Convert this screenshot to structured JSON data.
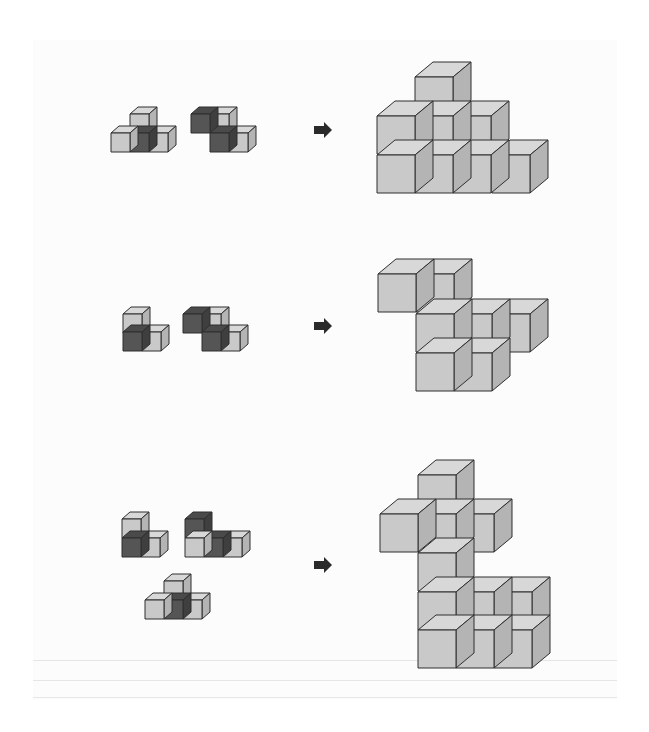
{
  "colors": {
    "front": "#c9c9c9",
    "top": "#d8d8d8",
    "side": "#b4b4b4",
    "dark_front": "#555555",
    "dark_top": "#4a4a4a",
    "dark_side": "#3f3f3f",
    "stroke": "#2f2f2f",
    "arrow": "#2a2a2a"
  },
  "puzzles": [
    {
      "label": "row-1",
      "pieces": [
        {
          "size": 19,
          "dx": 8,
          "dy": 7,
          "cubes": [
            {
              "x": 130,
              "y": 114,
              "dark": false
            },
            {
              "x": 111,
              "y": 133,
              "dark": false
            },
            {
              "x": 130,
              "y": 133,
              "dark": true
            },
            {
              "x": 149,
              "y": 133,
              "dark": false
            }
          ]
        },
        {
          "size": 19,
          "dx": 8,
          "dy": 7,
          "cubes": [
            {
              "x": 191,
              "y": 114,
              "dark": true
            },
            {
              "x": 210,
              "y": 114,
              "dark": false
            },
            {
              "x": 210,
              "y": 133,
              "dark": true
            },
            {
              "x": 229,
              "y": 133,
              "dark": false
            }
          ]
        }
      ],
      "arrow": {
        "x": 314,
        "y": 130
      },
      "result": {
        "size": 38,
        "dx": 18,
        "dy": 15,
        "cubes": [
          {
            "x": 415,
            "y": 77
          },
          {
            "x": 377,
            "y": 116
          },
          {
            "x": 415,
            "y": 116
          },
          {
            "x": 453,
            "y": 116
          },
          {
            "x": 377,
            "y": 155
          },
          {
            "x": 415,
            "y": 155
          },
          {
            "x": 453,
            "y": 155
          },
          {
            "x": 492,
            "y": 155
          }
        ]
      }
    },
    {
      "label": "row-2",
      "pieces": [
        {
          "size": 19,
          "dx": 8,
          "dy": 7,
          "cubes": [
            {
              "x": 123,
              "y": 314,
              "dark": false
            },
            {
              "x": 123,
              "y": 332,
              "dark": true
            },
            {
              "x": 142,
              "y": 332,
              "dark": false
            }
          ]
        },
        {
          "size": 19,
          "dx": 8,
          "dy": 7,
          "cubes": [
            {
              "x": 183,
              "y": 314,
              "dark": true
            },
            {
              "x": 202,
              "y": 314,
              "dark": false
            },
            {
              "x": 202,
              "y": 332,
              "dark": true
            },
            {
              "x": 221,
              "y": 332,
              "dark": false
            }
          ]
        }
      ],
      "arrow": {
        "x": 314,
        "y": 326
      },
      "result": {
        "size": 38,
        "dx": 18,
        "dy": 15,
        "cubes": [
          {
            "x": 378,
            "y": 274
          },
          {
            "x": 416,
            "y": 274
          },
          {
            "x": 416,
            "y": 353
          },
          {
            "x": 454,
            "y": 353
          },
          {
            "x": 416,
            "y": 314
          },
          {
            "x": 454,
            "y": 314
          },
          {
            "x": 492,
            "y": 314
          }
        ]
      }
    },
    {
      "label": "row-3",
      "pieces": [
        {
          "size": 19,
          "dx": 8,
          "dy": 7,
          "cubes": [
            {
              "x": 122,
              "y": 519,
              "dark": false
            },
            {
              "x": 122,
              "y": 538,
              "dark": true
            },
            {
              "x": 141,
              "y": 538,
              "dark": false
            }
          ]
        },
        {
          "size": 19,
          "dx": 8,
          "dy": 7,
          "cubes": [
            {
              "x": 185,
              "y": 519,
              "dark": true
            },
            {
              "x": 185,
              "y": 538,
              "dark": false
            },
            {
              "x": 204,
              "y": 538,
              "dark": true
            },
            {
              "x": 223,
              "y": 538,
              "dark": false
            }
          ]
        },
        {
          "size": 19,
          "dx": 8,
          "dy": 7,
          "cubes": [
            {
              "x": 164,
              "y": 581,
              "dark": false
            },
            {
              "x": 145,
              "y": 600,
              "dark": false
            },
            {
              "x": 164,
              "y": 600,
              "dark": true
            },
            {
              "x": 183,
              "y": 600,
              "dark": false
            }
          ]
        }
      ],
      "arrow": {
        "x": 314,
        "y": 565
      },
      "result": {
        "size": 38,
        "dx": 18,
        "dy": 15,
        "cubes": [
          {
            "x": 418,
            "y": 630
          },
          {
            "x": 456,
            "y": 630
          },
          {
            "x": 494,
            "y": 630
          },
          {
            "x": 418,
            "y": 592
          },
          {
            "x": 456,
            "y": 592
          },
          {
            "x": 494,
            "y": 592
          },
          {
            "x": 418,
            "y": 553
          },
          {
            "x": 380,
            "y": 514
          },
          {
            "x": 418,
            "y": 514
          },
          {
            "x": 456,
            "y": 514
          },
          {
            "x": 418,
            "y": 475
          }
        ]
      }
    }
  ]
}
